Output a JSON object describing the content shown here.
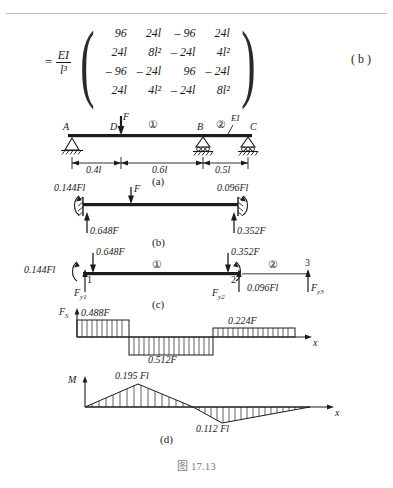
{
  "equation": {
    "equals": "=",
    "coefficient": {
      "numerator": "EI",
      "denominator": "l³"
    },
    "matrix": [
      [
        "96",
        "24l",
        "– 96",
        "24l"
      ],
      [
        "24l",
        "8l²",
        "– 24l",
        "4l²"
      ],
      [
        "– 96",
        "– 24l",
        "96",
        "– 24l"
      ],
      [
        "24l",
        "4l²",
        "– 24l",
        "8l²"
      ]
    ],
    "tag": "( b )"
  },
  "figure_a": {
    "caption": "(a)",
    "nodes": {
      "a": "A",
      "d": "D",
      "b": "B",
      "c": "C"
    },
    "load": "F",
    "elements": {
      "one": "①",
      "two": "②"
    },
    "stiffness": "EI",
    "dimensions": [
      "0.4l",
      "0.6l",
      "0.5l"
    ]
  },
  "figure_b": {
    "caption": "(b)",
    "load": "F",
    "moment_left": "0.144Fl",
    "moment_right": "0.096Fl",
    "reaction_left": "0.648F",
    "reaction_right": "0.352F"
  },
  "figure_c": {
    "caption": "(c)",
    "nodes": [
      "1",
      "2",
      "3"
    ],
    "elements": {
      "one": "①",
      "two": "②"
    },
    "moment_left": "0.144Fl",
    "moment_right": "0.096Fl",
    "force_left": "0.648F",
    "force_right": "0.352F",
    "reactions": [
      "F",
      "F",
      "F"
    ],
    "reaction_labels": [
      "y1",
      "y2",
      "y3"
    ]
  },
  "shear_diagram": {
    "axis_y": "F",
    "axis_y_sub": "S",
    "axis_x": "x",
    "values": [
      "0.488F",
      "0.512F",
      "0.224F"
    ]
  },
  "moment_diagram": {
    "caption": "(d)",
    "axis_y": "M",
    "axis_x": "x",
    "peak_positive": "0.195 Fl",
    "peak_negative": "0.112 Fl"
  },
  "figure_caption": "图  17.13",
  "colors": {
    "ink": "#1c1c1c",
    "rule": "#b9bcc2",
    "caption": "#7a7d84"
  }
}
